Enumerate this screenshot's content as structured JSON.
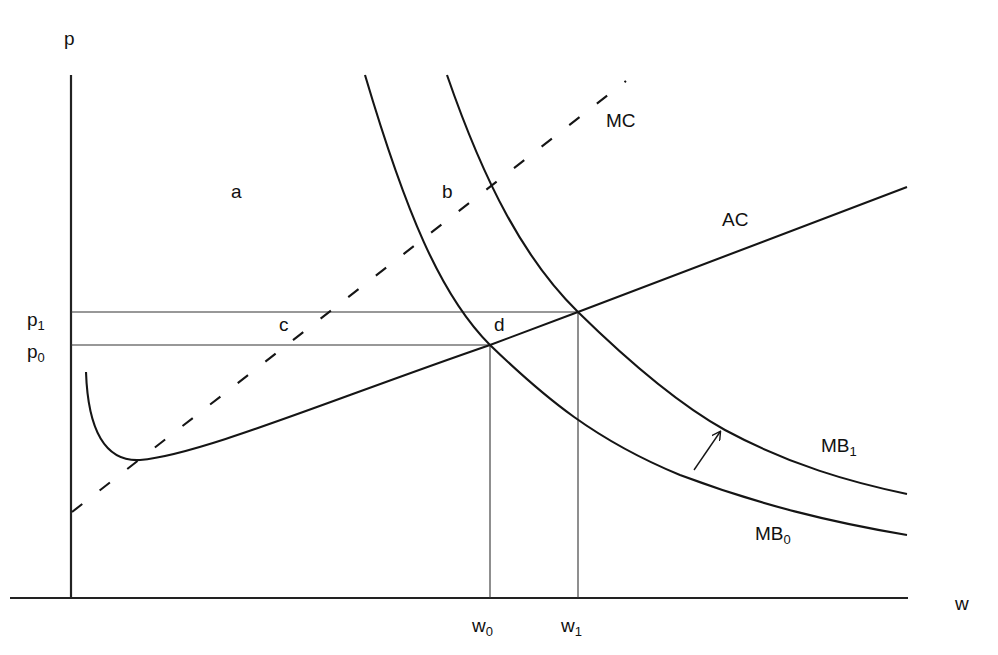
{
  "diagram": {
    "type": "economics-cost-benefit",
    "axes": {
      "y_label": "p",
      "x_label": "w",
      "y_ticks": [
        {
          "base": "p",
          "sub": "1",
          "label": "p1"
        },
        {
          "base": "p",
          "sub": "0",
          "label": "p0"
        }
      ],
      "x_ticks": [
        {
          "base": "w",
          "sub": "0",
          "label": "w0"
        },
        {
          "base": "w",
          "sub": "1",
          "label": "w1"
        }
      ]
    },
    "curves": {
      "mc": {
        "label": "MC",
        "style": "dashed"
      },
      "ac": {
        "label": "AC",
        "style": "solid"
      },
      "mb0": {
        "base": "MB",
        "sub": "0",
        "label": "MB0",
        "style": "solid"
      },
      "mb1": {
        "base": "MB",
        "sub": "1",
        "label": "MB1",
        "style": "solid"
      }
    },
    "regions": {
      "a": "a",
      "b": "b",
      "c": "c",
      "d": "d"
    },
    "annotations": {
      "shift_arrow": "arrow indicating shift from MB0 to MB1"
    },
    "colors": {
      "background": "#ffffff",
      "ink": "#151515"
    }
  }
}
